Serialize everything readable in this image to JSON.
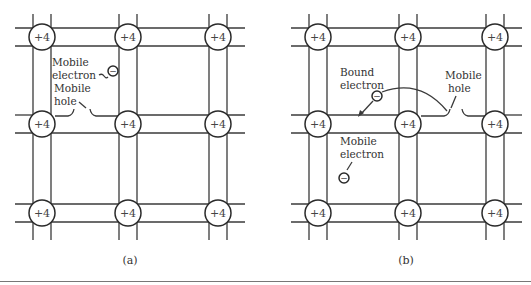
{
  "figure": {
    "panels": [
      {
        "id": "a",
        "caption": "(a)",
        "atom_charge": "+4",
        "xs": [
          42,
          128,
          218
        ],
        "ys": [
          37,
          124,
          213
        ],
        "labels": {
          "mobile_electron_line1": "Mobile",
          "mobile_electron_line2": "electron",
          "mobile_hole_line1": "Mobile",
          "mobile_hole_line2": "hole",
          "electron_symbol": "−"
        }
      },
      {
        "id": "b",
        "caption": "(b)",
        "atom_charge": "+4",
        "xs": [
          318,
          408,
          495
        ],
        "ys": [
          37,
          124,
          213
        ],
        "labels": {
          "bound_electron_line1": "Bound",
          "bound_electron_line2": "electron",
          "mobile_hole_line1": "Mobile",
          "mobile_hole_line2": "hole",
          "mobile_electron_line1": "Mobile",
          "mobile_electron_line2": "electron",
          "electron_symbol": "−"
        }
      }
    ],
    "colors": {
      "line": "#3a3a3a",
      "text": "#333333",
      "background": "#ffffff"
    }
  }
}
